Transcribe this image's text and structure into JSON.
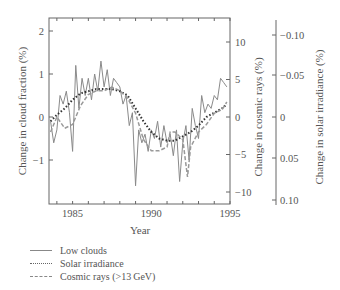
{
  "chart_data": {
    "type": "line",
    "title": "",
    "xlabel": "Year",
    "ylabel_left": "Change in cloud fraction (%)",
    "ylabel_right_1": "Change in cosmic rays (%)",
    "ylabel_right_2": "Change in solar irradiance (%)",
    "xlim": [
      1983.5,
      1995
    ],
    "x_ticks": [
      "1985",
      "1990",
      "1995"
    ],
    "ylim_left": [
      -2,
      2.2
    ],
    "y_ticks_left": [
      "2",
      "1",
      "0",
      "−1"
    ],
    "y_ticks_cosmic": [
      "10",
      "5",
      "0",
      "−5",
      "−10"
    ],
    "y_ticks_solar": [
      "−0.10",
      "−0.05",
      "0",
      "0.05",
      "0.10"
    ],
    "solar_axis_inverted": true,
    "grid": false,
    "legend_position": "below",
    "series": [
      {
        "name": "Low clouds",
        "style": "solid",
        "axis": "left",
        "x": [
          1983.6,
          1983.8,
          1984.0,
          1984.2,
          1984.4,
          1984.6,
          1984.8,
          1985.0,
          1985.2,
          1985.4,
          1985.6,
          1985.8,
          1986.0,
          1986.2,
          1986.4,
          1986.6,
          1986.8,
          1987.0,
          1987.2,
          1987.4,
          1987.6,
          1987.8,
          1988.0,
          1988.2,
          1988.4,
          1988.6,
          1988.8,
          1989.0,
          1989.2,
          1989.4,
          1989.6,
          1989.8,
          1990.0,
          1990.2,
          1990.4,
          1990.6,
          1990.8,
          1991.0,
          1991.2,
          1991.4,
          1991.6,
          1991.8,
          1992.0,
          1992.2,
          1992.4,
          1992.6,
          1992.8,
          1993.0,
          1993.2,
          1993.4,
          1993.6,
          1993.8,
          1994.0,
          1994.2,
          1994.4,
          1994.6,
          1994.8
        ],
        "values": [
          -0.1,
          -0.6,
          -0.3,
          0.5,
          0.3,
          0.6,
          0.1,
          -0.8,
          1.2,
          0.2,
          0.9,
          0.5,
          0.9,
          0.4,
          1.0,
          0.6,
          1.3,
          0.7,
          1.1,
          0.5,
          0.9,
          0.8,
          0.7,
          0.3,
          0.5,
          -0.2,
          0.1,
          -1.6,
          -0.3,
          -0.6,
          -0.4,
          -0.8,
          -0.3,
          -0.5,
          -0.1,
          -0.7,
          -0.2,
          -0.6,
          -0.4,
          -0.9,
          -0.3,
          -1.5,
          -0.6,
          -0.2,
          -1.0,
          0.2,
          -0.2,
          -0.5,
          0.5,
          0.1,
          0.3,
          0.2,
          0.5,
          0.4,
          0.9,
          0.8,
          0.7
        ]
      },
      {
        "name": "Solar irradiance",
        "style": "dotted",
        "axis": "solar",
        "x": [
          1983.6,
          1984.0,
          1984.5,
          1985.0,
          1985.5,
          1986.0,
          1986.5,
          1987.0,
          1987.5,
          1988.0,
          1988.5,
          1989.0,
          1989.5,
          1990.0,
          1990.5,
          1991.0,
          1991.5,
          1992.0,
          1992.5,
          1993.0,
          1993.5,
          1994.0,
          1994.5,
          1994.8
        ],
        "values_cloud_scale": [
          -0.1,
          0.05,
          0.2,
          0.4,
          0.55,
          0.6,
          0.65,
          0.65,
          0.65,
          0.6,
          0.5,
          0.2,
          -0.1,
          -0.35,
          -0.5,
          -0.55,
          -0.55,
          -0.45,
          -0.35,
          -0.2,
          0.0,
          0.1,
          0.2,
          0.3
        ]
      },
      {
        "name": "Cosmic rays (>13 GeV)",
        "style": "dashed",
        "axis": "cosmic",
        "x": [
          1983.6,
          1984.0,
          1984.5,
          1985.0,
          1985.5,
          1986.0,
          1986.5,
          1987.0,
          1987.5,
          1988.0,
          1988.5,
          1989.0,
          1989.5,
          1990.0,
          1990.5,
          1991.0,
          1991.2,
          1991.5,
          1992.0,
          1992.3,
          1992.5,
          1993.0,
          1993.5,
          1994.0,
          1994.5,
          1994.8
        ],
        "values": [
          -2,
          0,
          -1.5,
          -1,
          1.5,
          3,
          3.5,
          3.5,
          4,
          3.5,
          2.5,
          0.5,
          -3,
          -4.5,
          -4.5,
          -4,
          -2,
          -2,
          -3,
          -8,
          -4,
          -2,
          -1,
          0.5,
          1,
          2
        ]
      }
    ]
  },
  "legend": {
    "items": [
      {
        "label": "Low clouds",
        "style": "solid"
      },
      {
        "label": "Solar irradiance",
        "style": "dotted"
      },
      {
        "label": "Cosmic rays (>13 GeV)",
        "style": "dashed"
      }
    ]
  }
}
